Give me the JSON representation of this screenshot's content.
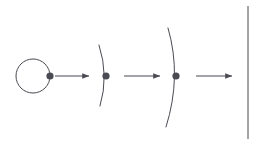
{
  "canvas": {
    "width": 263,
    "height": 144,
    "background": "#ffffff",
    "title": "Wavefront propagation diagram"
  },
  "style": {
    "stroke_color": "#4a4a52",
    "dot_color": "#4a4a52",
    "stroke_width": 1,
    "arrow_stroke_width": 1.1,
    "dot_radius": 3.6
  },
  "diagram": {
    "stages": [
      {
        "name": "point-source-circle",
        "kind": "circle",
        "cx": 33,
        "cy": 76,
        "r": 17
      },
      {
        "name": "curved-wavefront-1",
        "kind": "arc",
        "path": "M 99 45 Q 109 76 100 106"
      },
      {
        "name": "curved-wavefront-2",
        "kind": "arc",
        "path": "M 168 28 Q 182 76 166 127"
      },
      {
        "name": "plane-wavefront-line",
        "kind": "line",
        "x1": 248,
        "y1": 6,
        "x2": 248,
        "y2": 139
      }
    ],
    "markers": [
      {
        "name": "wavefront-dot-1",
        "cx": 50,
        "cy": 76
      },
      {
        "name": "wavefront-dot-2",
        "cx": 106,
        "cy": 76
      },
      {
        "name": "wavefront-dot-3",
        "cx": 176,
        "cy": 76
      }
    ],
    "arrows": [
      {
        "name": "propagation-arrow-1",
        "x1": 55,
        "y1": 76,
        "x2": 89,
        "y2": 76
      },
      {
        "name": "propagation-arrow-2",
        "x1": 124,
        "y1": 76,
        "x2": 160,
        "y2": 76
      },
      {
        "name": "propagation-arrow-3",
        "x1": 196,
        "y1": 76,
        "x2": 232,
        "y2": 76
      }
    ]
  }
}
